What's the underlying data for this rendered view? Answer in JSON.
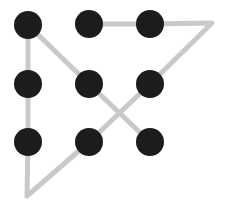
{
  "screen": {
    "name": "android-pattern-lock",
    "width": 229,
    "height": 215,
    "background_color": "#ffffff"
  },
  "pattern": {
    "dot_color": "#1c1c1c",
    "dot_radius": 14,
    "trail_color": "#c9c9c9",
    "trail_width": 5,
    "grid": {
      "columns": 3,
      "rows": 3,
      "x_positions": [
        28,
        89,
        150
      ],
      "y_positions": [
        25,
        84,
        142
      ],
      "spacing_x": 61,
      "spacing_y": 59
    },
    "dots": [
      {
        "id": "dot-1",
        "row": 0,
        "col": 0,
        "cx": 28,
        "cy": 25,
        "label": "1"
      },
      {
        "id": "dot-2",
        "row": 0,
        "col": 1,
        "cx": 89,
        "cy": 24,
        "label": "2"
      },
      {
        "id": "dot-3",
        "row": 0,
        "col": 2,
        "cx": 150,
        "cy": 24,
        "label": "3"
      },
      {
        "id": "dot-4",
        "row": 1,
        "col": 0,
        "cx": 28,
        "cy": 84,
        "label": "4"
      },
      {
        "id": "dot-5",
        "row": 1,
        "col": 1,
        "cx": 89,
        "cy": 84,
        "label": "5"
      },
      {
        "id": "dot-6",
        "row": 1,
        "col": 2,
        "cx": 150,
        "cy": 84,
        "label": "6"
      },
      {
        "id": "dot-7",
        "row": 2,
        "col": 0,
        "cx": 28,
        "cy": 142,
        "label": "7"
      },
      {
        "id": "dot-8",
        "row": 2,
        "col": 1,
        "cx": 89,
        "cy": 142,
        "label": "8"
      },
      {
        "id": "dot-9",
        "row": 2,
        "col": 2,
        "cx": 150,
        "cy": 142,
        "label": "9"
      }
    ],
    "outer_vertices": [
      {
        "id": "vertex-right",
        "x": 212,
        "y": 23
      },
      {
        "id": "vertex-bottom",
        "x": 27,
        "y": 196
      }
    ],
    "strokes": [
      {
        "id": "stroke-left-column-to-bottom-vertex-to-right-vertex",
        "points": "28,25 28,84 28,142 27,196 89,142 150,84 212,23 150,24 89,24"
      },
      {
        "id": "stroke-diagonal-topleft-to-bottomright",
        "points": "28,25 89,84 150,142"
      }
    ]
  }
}
